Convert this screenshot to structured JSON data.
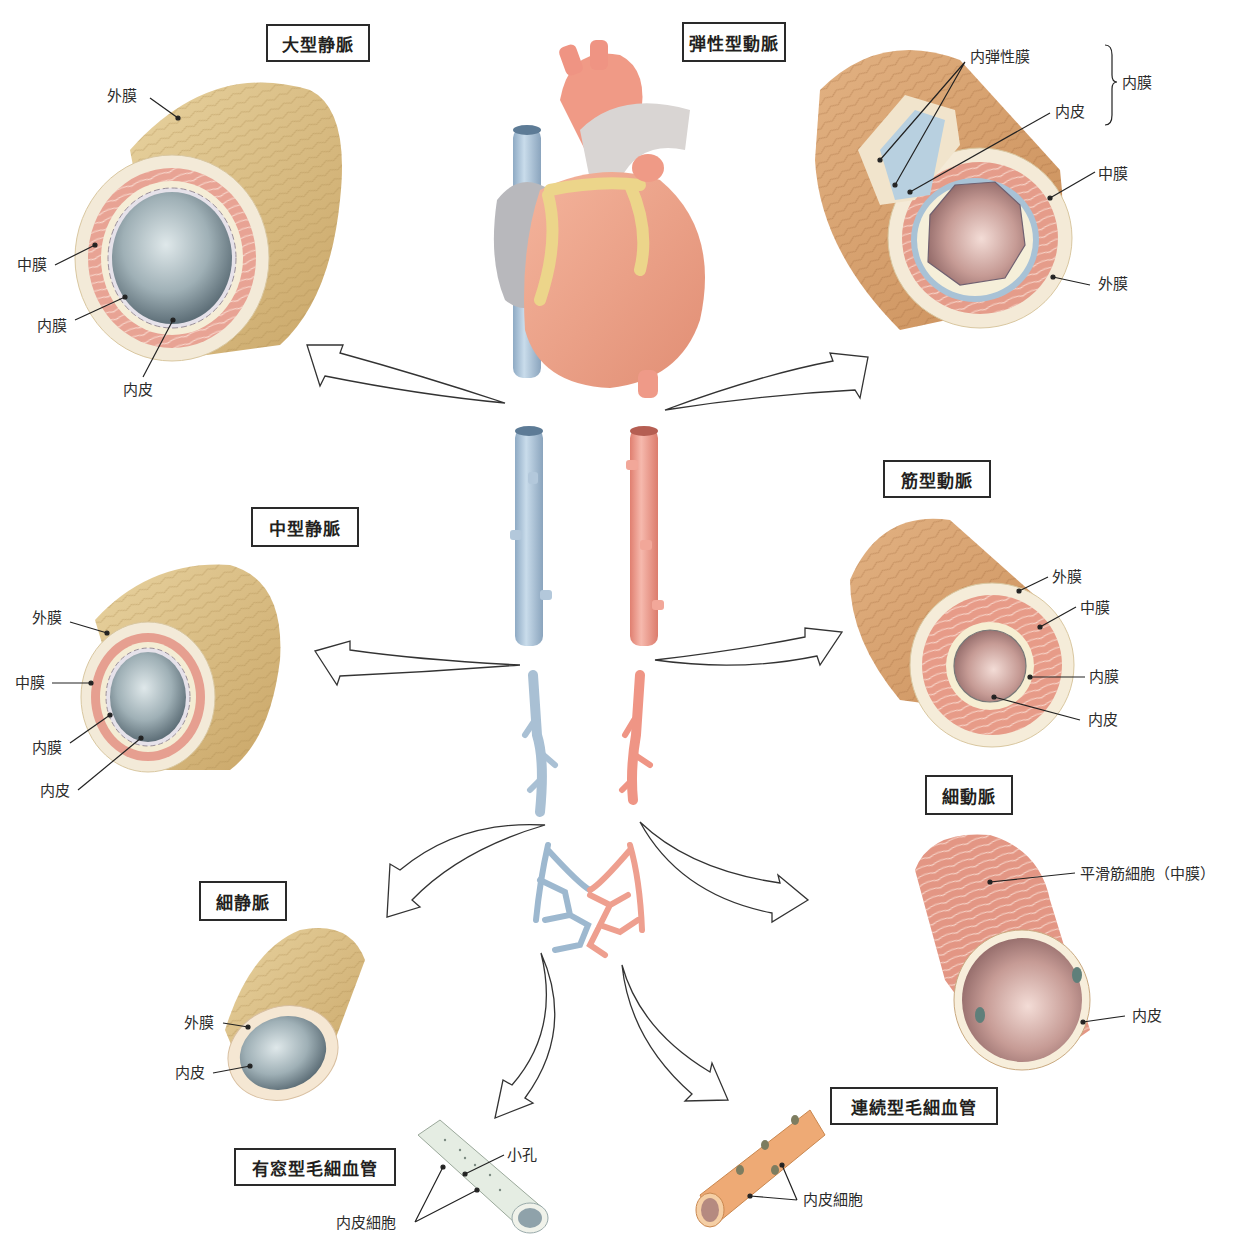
{
  "titles": {
    "large_vein": "大型静脈",
    "elastic_artery": "弾性型動脈",
    "medium_vein": "中型静脈",
    "muscular_artery": "筋型動脈",
    "arteriole": "細動脈",
    "venule": "細静脈",
    "fenestrated_capillary": "有窓型毛細血管",
    "continuous_capillary": "連続型毛細血管"
  },
  "large_vein": {
    "labels": {
      "adventitia": "外膜",
      "media": "中膜",
      "intima": "内膜",
      "endothelium": "内皮"
    }
  },
  "elastic_artery": {
    "labels": {
      "internal_elastic_lamina": "内弾性膜",
      "endothelium": "内皮",
      "intima_group": "内膜",
      "media": "中膜",
      "adventitia": "外膜"
    }
  },
  "medium_vein": {
    "labels": {
      "adventitia": "外膜",
      "media": "中膜",
      "intima": "内膜",
      "endothelium": "内皮"
    }
  },
  "muscular_artery": {
    "labels": {
      "adventitia": "外膜",
      "media": "中膜",
      "intima": "内膜",
      "endothelium": "内皮"
    }
  },
  "arteriole": {
    "labels": {
      "smooth_muscle": "平滑筋細胞（中膜）",
      "endothelium": "内皮"
    }
  },
  "venule": {
    "labels": {
      "adventitia": "外膜",
      "endothelium": "内皮"
    }
  },
  "fenestrated_capillary": {
    "labels": {
      "pore": "小孔",
      "endothelial_cell": "内皮細胞"
    }
  },
  "continuous_capillary": {
    "labels": {
      "endothelial_cell": "内皮細胞"
    }
  },
  "colors": {
    "vein_blue": "#9db8cf",
    "artery_red": "#e98f80",
    "adventitia_tan": "#d8bb7e",
    "media_pink": "#e39a88",
    "lumen_vein": "#7f929c",
    "lumen_artery": "#b88a86"
  }
}
